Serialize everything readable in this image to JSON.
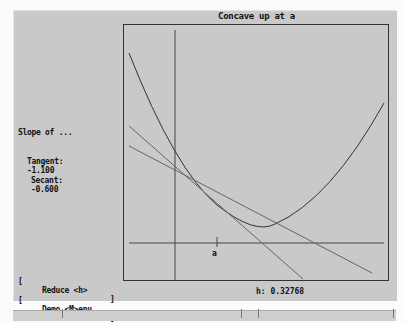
{
  "graph": {
    "title": "Concave up at a",
    "point_label": "a"
  },
  "sidebar": {
    "heading": "Slope of ...",
    "tangent_label": "Tangent:",
    "tangent_value": "-1.100",
    "secant_label": "Secant:",
    "secant_value": "-0.600"
  },
  "buttons": {
    "reduce": {
      "open": "[",
      "label": "Reduce <h>",
      "close": "]"
    },
    "demo_menu": {
      "open": "[",
      "label": "Demo <M>enu",
      "close": "]"
    }
  },
  "status": {
    "h_label": "h:",
    "h_value": "0.32768"
  },
  "colors": {
    "panel_bg": "#c9c9c9",
    "curve": "#333333",
    "tangent_line": "#666666",
    "secant_line": "#666666",
    "axes": "#444444"
  }
}
